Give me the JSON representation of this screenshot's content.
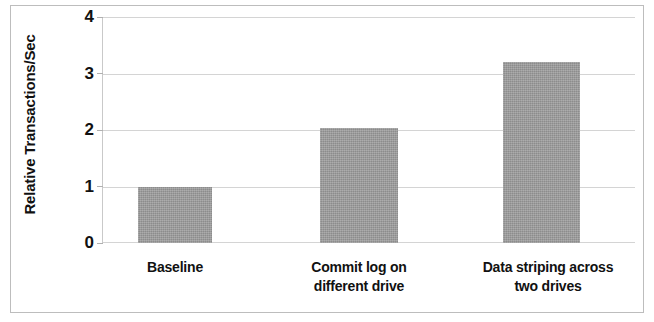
{
  "chart_data": {
    "type": "bar",
    "title": "",
    "xlabel": "",
    "ylabel": "Relative Transactions/Sec",
    "categories": [
      "Baseline",
      "Commit log on different drive",
      "Data striping across two drives"
    ],
    "category_lines": [
      [
        "Baseline"
      ],
      [
        "Commit log on",
        "different drive"
      ],
      [
        "Data striping across",
        "two drives"
      ]
    ],
    "values": [
      1.0,
      2.03,
      3.2
    ],
    "ylim": [
      0,
      4
    ],
    "yticks": [
      0,
      1,
      2,
      3,
      4
    ],
    "ytick_labels": [
      "0",
      "1",
      "2",
      "3",
      "4"
    ],
    "grid": true,
    "legend": false,
    "bar_color": "#9a9a9a",
    "gridline_color": "#d4d4d4",
    "frame_color": "#bdbdbd",
    "text_color": "#111111"
  }
}
